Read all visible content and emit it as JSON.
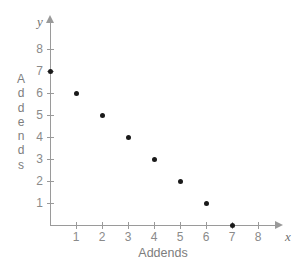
{
  "chart_data": {
    "type": "scatter",
    "title": "",
    "xlabel": "Addends",
    "ylabel": "Addends",
    "x_var": "x",
    "y_var": "y",
    "xlim": [
      0,
      8.7
    ],
    "ylim": [
      0,
      9.3
    ],
    "grid": false,
    "legend": null,
    "x_ticks": [
      1,
      2,
      3,
      4,
      5,
      6,
      7,
      8
    ],
    "y_ticks": [
      1,
      2,
      3,
      4,
      5,
      6,
      7,
      8
    ],
    "x_tick_labels": [
      "1",
      "2",
      "3",
      "4",
      "5",
      "6",
      "7",
      "8"
    ],
    "y_tick_labels": [
      "1",
      "2",
      "3",
      "4",
      "5",
      "6",
      "7",
      "8"
    ],
    "points": [
      {
        "x": 0,
        "y": 7
      },
      {
        "x": 1,
        "y": 6
      },
      {
        "x": 2,
        "y": 5
      },
      {
        "x": 3,
        "y": 4
      },
      {
        "x": 4,
        "y": 3
      },
      {
        "x": 5,
        "y": 2
      },
      {
        "x": 6,
        "y": 1
      },
      {
        "x": 7,
        "y": 0
      }
    ],
    "x_values": [
      0,
      1,
      2,
      3,
      4,
      5,
      6,
      7
    ],
    "y_values": [
      7,
      6,
      5,
      4,
      3,
      2,
      1,
      0
    ],
    "marker_color": "#1a1a1a",
    "axis_color": "#9a9a9a",
    "text_color": "#7d7d7d",
    "background": "#ffffff"
  },
  "y_axis_title_letters": [
    "A",
    "d",
    "d",
    "e",
    "n",
    "d",
    "s"
  ]
}
